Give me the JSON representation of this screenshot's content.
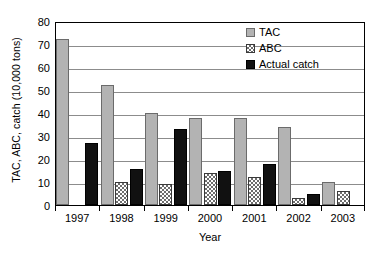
{
  "chart_data": {
    "type": "bar",
    "title": "",
    "subtitle": "",
    "xlabel": "Year",
    "ylabel": "TAC, ABC, catch (10,000 tons)",
    "categories": [
      "1997",
      "1998",
      "1999",
      "2000",
      "2001",
      "2002",
      "2003"
    ],
    "series": [
      {
        "name": "TAC",
        "color": "#b3b3b3",
        "pattern": "solid-light-gray",
        "values": [
          72,
          52,
          40,
          38,
          38,
          34,
          10
        ]
      },
      {
        "name": "ABC",
        "color": "#ffffff",
        "pattern": "checkerboard-hatch",
        "values": [
          null,
          10,
          9,
          14,
          12,
          3,
          6
        ]
      },
      {
        "name": "Actual catch",
        "color": "#111111",
        "pattern": "solid-black",
        "values": [
          27,
          15.5,
          33,
          15,
          18,
          5,
          null
        ]
      }
    ],
    "ylim": [
      0,
      80
    ],
    "ytick_values": [
      0,
      10,
      20,
      30,
      40,
      50,
      60,
      70,
      80
    ],
    "ytick_labels": [
      "0",
      "10",
      "20",
      "30",
      "40",
      "50",
      "60",
      "70",
      "80"
    ],
    "grid": "horizontal",
    "legend_position": "top-right",
    "legend_entries": [
      "TAC",
      "ABC",
      "Actual catch"
    ],
    "frame": "full-box"
  },
  "axes": {
    "y_title": "TAC, ABC, catch (10,000 tons)",
    "x_title": "Year"
  },
  "legend": {
    "items": [
      {
        "label": "TAC",
        "swatch": "tac-swatch-icon"
      },
      {
        "label": "ABC",
        "swatch": "abc-swatch-icon"
      },
      {
        "label": "Actual catch",
        "swatch": "catch-swatch-icon"
      }
    ]
  }
}
